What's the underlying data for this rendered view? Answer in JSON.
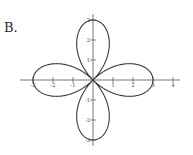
{
  "option_label": "B.",
  "chart_data": {
    "type": "line",
    "title": "",
    "equation": "r = 3cos(2θ)",
    "xlabel": "",
    "ylabel": "",
    "x_ticks": [
      -3,
      -2,
      -1,
      1,
      2,
      3,
      4
    ],
    "y_ticks": [
      3,
      2,
      1,
      -1,
      -2,
      -3
    ],
    "x_tick_labels": [
      "-3",
      "-2",
      "-1",
      "1",
      "2",
      "3",
      "4"
    ],
    "y_tick_labels": [
      "3",
      "2",
      "1",
      "-1",
      "-2",
      "-3"
    ],
    "xlim": [
      -3.5,
      4.3
    ],
    "ylim": [
      -3.3,
      3.3
    ],
    "grid": false,
    "petal_tips": [
      [
        3,
        0
      ],
      [
        0,
        3
      ],
      [
        -3,
        0
      ],
      [
        0,
        -3
      ]
    ],
    "petals": 4,
    "amplitude": 3
  },
  "colors": {
    "curve": "#3a3a3a",
    "axis": "#555555",
    "background": "#ffffff"
  }
}
